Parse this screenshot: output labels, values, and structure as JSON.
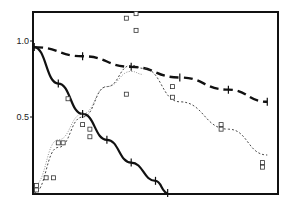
{
  "chart_data": {
    "type": "line",
    "title": "",
    "xlabel": "",
    "ylabel": "",
    "ylim": [
      0,
      1.2
    ],
    "xlim": [
      0,
      1
    ],
    "grid": false,
    "legend": null,
    "yticks": [
      {
        "value": 0.5,
        "label": "0.5"
      },
      {
        "value": 1.0,
        "label": "1.0"
      }
    ],
    "series": [
      {
        "name": "solid decay",
        "style": "solid-thick",
        "x": [
          0,
          0.1,
          0.2,
          0.3,
          0.4,
          0.5,
          0.55
        ],
        "y": [
          0.96,
          0.72,
          0.52,
          0.35,
          0.2,
          0.08,
          0.0
        ]
      },
      {
        "name": "dashed slow decay",
        "style": "dashed-thick",
        "x": [
          0,
          0.2,
          0.4,
          0.6,
          0.8,
          0.96
        ],
        "y": [
          0.96,
          0.9,
          0.83,
          0.76,
          0.68,
          0.6
        ]
      },
      {
        "name": "dotted rise-fall",
        "style": "dotted",
        "x": [
          0,
          0.1,
          0.2,
          0.3,
          0.4,
          0.45,
          0.6,
          0.8,
          0.96
        ],
        "y": [
          0.0,
          0.3,
          0.5,
          0.7,
          0.84,
          0.82,
          0.6,
          0.42,
          0.25
        ]
      },
      {
        "name": "dotted light rise",
        "style": "dotted-light",
        "x": [
          0,
          0.1,
          0.2,
          0.3,
          0.4,
          0.45
        ],
        "y": [
          0.05,
          0.35,
          0.52,
          0.7,
          0.8,
          0.78
        ]
      }
    ],
    "scatter_points": [
      {
        "x": 0.01,
        "y": 0.02
      },
      {
        "x": 0.01,
        "y": 0.05
      },
      {
        "x": 0.05,
        "y": 0.1
      },
      {
        "x": 0.08,
        "y": 0.1
      },
      {
        "x": 0.1,
        "y": 0.33
      },
      {
        "x": 0.12,
        "y": 0.33
      },
      {
        "x": 0.14,
        "y": 0.62
      },
      {
        "x": 0.2,
        "y": 0.45
      },
      {
        "x": 0.23,
        "y": 0.42
      },
      {
        "x": 0.23,
        "y": 0.37
      },
      {
        "x": 0.38,
        "y": 1.15
      },
      {
        "x": 0.42,
        "y": 1.18
      },
      {
        "x": 0.42,
        "y": 1.07
      },
      {
        "x": 0.38,
        "y": 0.65
      },
      {
        "x": 0.57,
        "y": 0.7
      },
      {
        "x": 0.57,
        "y": 0.63
      },
      {
        "x": 0.77,
        "y": 0.45
      },
      {
        "x": 0.77,
        "y": 0.42
      },
      {
        "x": 0.94,
        "y": 0.2
      },
      {
        "x": 0.94,
        "y": 0.17
      }
    ]
  }
}
